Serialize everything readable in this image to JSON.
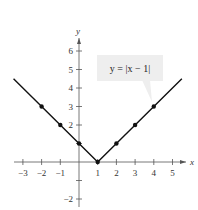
{
  "chart_data": {
    "type": "line",
    "title": "",
    "equation_label": "y = |x − 1|",
    "xlabel": "x",
    "ylabel": "y",
    "xlim": [
      -3.5,
      5.5
    ],
    "ylim": [
      -2.5,
      6.5
    ],
    "x_ticks": [
      -3,
      -2,
      -1,
      1,
      2,
      3,
      4,
      5
    ],
    "y_ticks": [
      -2,
      2,
      3,
      4,
      5,
      6
    ],
    "x_tick_labels": [
      "−3",
      "−2",
      "−1",
      "1",
      "2",
      "3",
      "4",
      "5"
    ],
    "y_tick_labels": [
      "−2",
      "2",
      "3",
      "4",
      "5",
      "6"
    ],
    "grid": false,
    "series": [
      {
        "name": "y = |x − 1|",
        "line": [
          [
            -3.5,
            4.5
          ],
          [
            1,
            0
          ],
          [
            5.5,
            4.5
          ]
        ],
        "points": [
          [
            -2,
            3
          ],
          [
            -1,
            2
          ],
          [
            0,
            1
          ],
          [
            1,
            0
          ],
          [
            2,
            1
          ],
          [
            3,
            2
          ],
          [
            4,
            3
          ]
        ]
      }
    ],
    "colors": {
      "line": "#111111",
      "axis": "#555555",
      "callout_bg": "#eeeeee"
    }
  }
}
